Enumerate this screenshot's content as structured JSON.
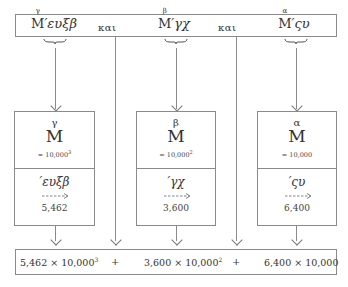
{
  "top_expression": {
    "groups": [
      {
        "sup": "γ",
        "M": "M",
        "rest": "′ευξβ"
      },
      {
        "sup": "β",
        "M": "M",
        "rest": "′γχ"
      },
      {
        "sup": "α",
        "M": "M",
        "rest": "′ςυ"
      }
    ],
    "connectors": [
      "και",
      "και"
    ]
  },
  "boxes": [
    {
      "letter": "γ",
      "M": "M",
      "equals": "= 10,000",
      "exp": "3",
      "greek": "′ευξβ",
      "value": "5,462"
    },
    {
      "letter": "β",
      "M": "M",
      "equals": "= 10,000",
      "exp": "2",
      "greek": "′γχ",
      "value": "3,600"
    },
    {
      "letter": "α",
      "M": "M",
      "equals": "= 10,000",
      "exp": "",
      "greek": "′ςυ",
      "value": "6,400"
    }
  ],
  "result": {
    "terms": [
      {
        "base": "5,462 × 10,000",
        "exp": "3"
      },
      {
        "base": "3,600 × 10,000",
        "exp": "2"
      },
      {
        "base": "6,400 × 10,000",
        "exp": ""
      }
    ],
    "operators": [
      "+",
      "+"
    ]
  },
  "colors": {
    "line": "#8a8a8a",
    "text": "#333333"
  }
}
